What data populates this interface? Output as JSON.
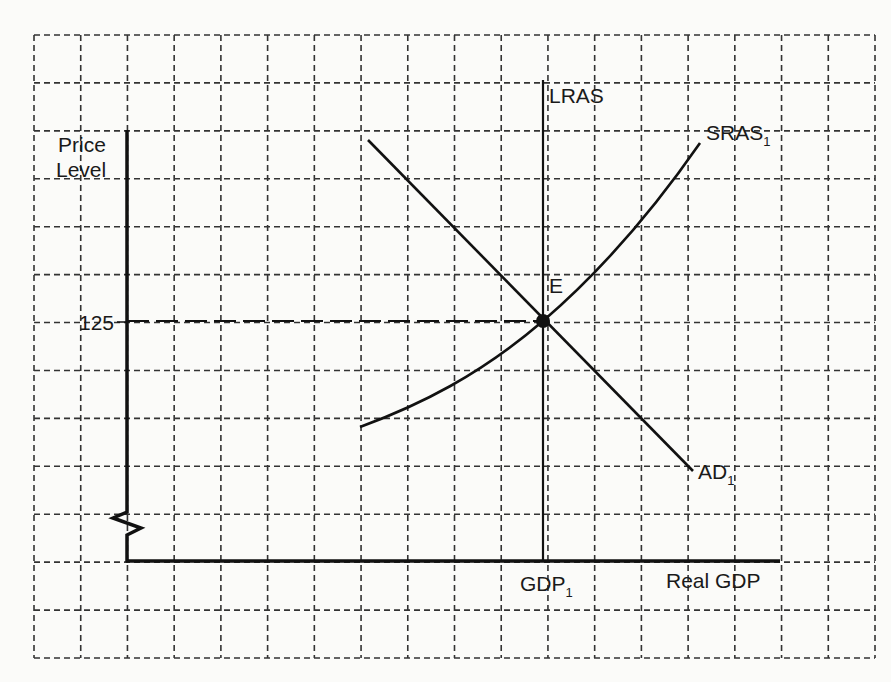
{
  "diagram": {
    "type": "AD-AS macroeconomic equilibrium diagram",
    "y_axis_label_line1": "Price",
    "y_axis_label_line2": "Level",
    "x_axis_label": "Real GDP",
    "price_tick": "125",
    "gdp_tick_base": "GDP",
    "gdp_tick_sub": "1",
    "lras_label": "LRAS",
    "sras_label_base": "SRAS",
    "sras_label_sub": "1",
    "ad_label_base": "AD",
    "ad_label_sub": "1",
    "equilibrium_label": "E",
    "axis_break": "zigzag on y-axis",
    "grid": {
      "style": "dashed",
      "columns": 18,
      "rows": 13
    }
  },
  "chart_data": {
    "type": "line",
    "title": "",
    "xlabel": "Real GDP",
    "ylabel": "Price Level",
    "grid": true,
    "series": [
      {
        "name": "LRAS",
        "shape": "vertical",
        "x": "GDP1"
      },
      {
        "name": "SRAS1",
        "shape": "upward-sloping convex curve",
        "passes_through": "E"
      },
      {
        "name": "AD1",
        "shape": "downward-sloping line",
        "passes_through": "E"
      }
    ],
    "annotations": [
      {
        "label": "E",
        "x": "GDP1",
        "y": 125,
        "note": "equilibrium point"
      },
      {
        "label": "125",
        "axis": "y",
        "dashed_guide": true
      },
      {
        "label": "GDP1",
        "axis": "x"
      }
    ]
  }
}
